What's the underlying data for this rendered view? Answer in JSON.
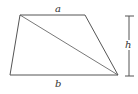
{
  "diagram": {
    "type": "trapezoid-with-diagonal",
    "labels": {
      "top": "a",
      "bottom": "b",
      "height": "h"
    },
    "colors": {
      "stroke": "#555555",
      "text": "#333333",
      "background": "#ffffff"
    }
  }
}
